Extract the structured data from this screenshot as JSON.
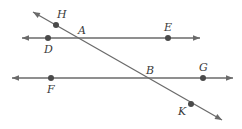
{
  "diagram": {
    "type": "geometry-parallel-lines-transversal",
    "colors": {
      "line": "#6a6a6a",
      "point": "#4a4a4a",
      "label": "#3a3a3a",
      "background": "#ffffff"
    },
    "lines": [
      {
        "id": "line-DE",
        "x1": 22,
        "y1": 38,
        "x2": 200,
        "y2": 38,
        "arrows": "both"
      },
      {
        "id": "line-FG",
        "x1": 12,
        "y1": 78,
        "x2": 233,
        "y2": 78,
        "arrows": "both"
      },
      {
        "id": "transversal-HK",
        "x1": 33,
        "y1": 12,
        "x2": 222,
        "y2": 120,
        "arrows": "both"
      }
    ],
    "points": [
      {
        "name": "H",
        "x": 56,
        "y": 25,
        "dot": true,
        "label_x": 57,
        "label_y": 18
      },
      {
        "name": "A",
        "x": 79,
        "y": 38,
        "dot": false,
        "label_x": 78,
        "label_y": 34
      },
      {
        "name": "D",
        "x": 48,
        "y": 38,
        "dot": true,
        "label_x": 44,
        "label_y": 53
      },
      {
        "name": "E",
        "x": 168,
        "y": 38,
        "dot": true,
        "label_x": 164,
        "label_y": 31
      },
      {
        "name": "B",
        "x": 145,
        "y": 78,
        "dot": false,
        "label_x": 146,
        "label_y": 74
      },
      {
        "name": "G",
        "x": 203,
        "y": 78,
        "dot": true,
        "label_x": 199,
        "label_y": 71
      },
      {
        "name": "F",
        "x": 51,
        "y": 78,
        "dot": true,
        "label_x": 47,
        "label_y": 93
      },
      {
        "name": "K",
        "x": 191,
        "y": 104,
        "dot": true,
        "label_x": 178,
        "label_y": 115
      }
    ]
  }
}
